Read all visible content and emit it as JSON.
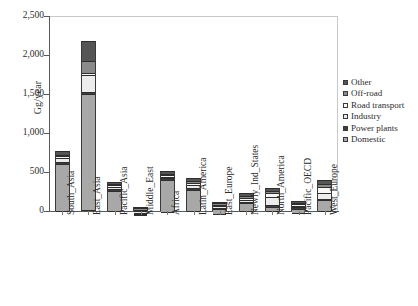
{
  "chart_data": {
    "type": "bar",
    "subtype": "stacked-bar",
    "title": "",
    "xlabel": "",
    "ylabel": "Gg/year",
    "ylim": [
      0,
      2500
    ],
    "yticks": [
      0,
      500,
      1000,
      1500,
      2000,
      2500
    ],
    "ytick_labels": [
      "0",
      "500",
      "1,000",
      "1,500",
      "2,000",
      "2,500"
    ],
    "grid": false,
    "legend_position": "right",
    "categories": [
      "South_Asia",
      "East_Asia",
      "Pacific_Asia",
      "Middle_East",
      "Africa",
      "Latin_America",
      "East_Europe",
      "Newly_Ind_States",
      "North_America",
      "Pacific_OECD",
      "West_Europe"
    ],
    "series": [
      {
        "name": "Domestic",
        "color": "#a8a8a8",
        "values": [
          615,
          1505,
          275,
          10,
          430,
          280,
          75,
          110,
          65,
          60,
          145
        ]
      },
      {
        "name": "Power plants",
        "color": "#3d3d3d",
        "values": [
          20,
          25,
          10,
          5,
          10,
          10,
          5,
          10,
          10,
          5,
          10
        ]
      },
      {
        "name": "Industry",
        "color": "#ececec",
        "values": [
          55,
          215,
          35,
          10,
          15,
          40,
          10,
          25,
          100,
          20,
          75
        ]
      },
      {
        "name": "Road transport",
        "color": "#f7f7f7",
        "values": [
          15,
          30,
          20,
          15,
          10,
          30,
          10,
          20,
          55,
          10,
          75
        ]
      },
      {
        "name": "Off-road",
        "color": "#8a8a8a",
        "values": [
          15,
          150,
          15,
          10,
          15,
          25,
          10,
          25,
          30,
          10,
          45
        ]
      },
      {
        "name": "Other",
        "color": "#555555",
        "values": [
          50,
          255,
          15,
          5,
          30,
          35,
          10,
          40,
          35,
          20,
          50
        ]
      }
    ],
    "totals": [
      770,
      2180,
      370,
      55,
      510,
      420,
      120,
      230,
      295,
      125,
      400
    ]
  },
  "legend": {
    "items": [
      {
        "label": "Other",
        "color": "#555555"
      },
      {
        "label": "Off-road",
        "color": "#8a8a8a"
      },
      {
        "label": "Road transport",
        "color": "#f7f7f7"
      },
      {
        "label": "Industry",
        "color": "#ececec"
      },
      {
        "label": "Power plants",
        "color": "#3d3d3d"
      },
      {
        "label": "Domestic",
        "color": "#a8a8a8"
      }
    ]
  }
}
